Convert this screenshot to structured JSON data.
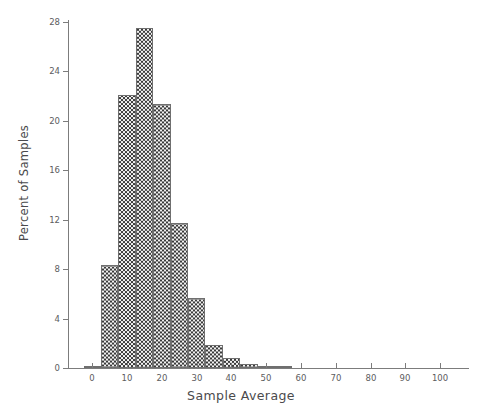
{
  "chart_data": {
    "type": "bar",
    "title": "",
    "subtitle": "",
    "xlabel": "Sample Average",
    "ylabel": "Percent of Samples",
    "xlim": [
      -7,
      108
    ],
    "ylim": [
      0,
      28
    ],
    "grid": false,
    "legend": null,
    "xticks": [
      0,
      10,
      20,
      30,
      40,
      50,
      60,
      70,
      80,
      90,
      100
    ],
    "xtick_labels": [
      "0",
      "10",
      "20",
      "30",
      "40",
      "50",
      "60",
      "70",
      "80",
      "90",
      "100"
    ],
    "yticks": [
      0,
      4,
      8,
      12,
      16,
      20,
      24,
      28
    ],
    "ytick_labels": [
      "0",
      "4",
      "8",
      "12",
      "16",
      "20",
      "24",
      "28"
    ],
    "bin_width": 5,
    "bin_starts": [
      -2.5,
      2.5,
      7.5,
      12.5,
      17.5,
      22.5,
      27.5,
      32.5,
      37.5,
      42.5,
      47.5,
      52.5
    ],
    "categories": [
      "-2.5-2.5",
      "2.5-7.5",
      "7.5-12.5",
      "12.5-17.5",
      "17.5-22.5",
      "22.5-27.5",
      "27.5-32.5",
      "32.5-37.5",
      "37.5-42.5",
      "42.5-47.5",
      "47.5-52.5",
      "52.5-57.5"
    ],
    "values": [
      0.2,
      8.3,
      22.1,
      27.5,
      21.4,
      11.7,
      5.7,
      1.9,
      0.8,
      0.3,
      0.2,
      0.1
    ],
    "bar_fill": "#b9b9b9",
    "bar_edge": "#6f6f6f",
    "axis_color": "#7c7c7c",
    "background": "#ffffff"
  }
}
